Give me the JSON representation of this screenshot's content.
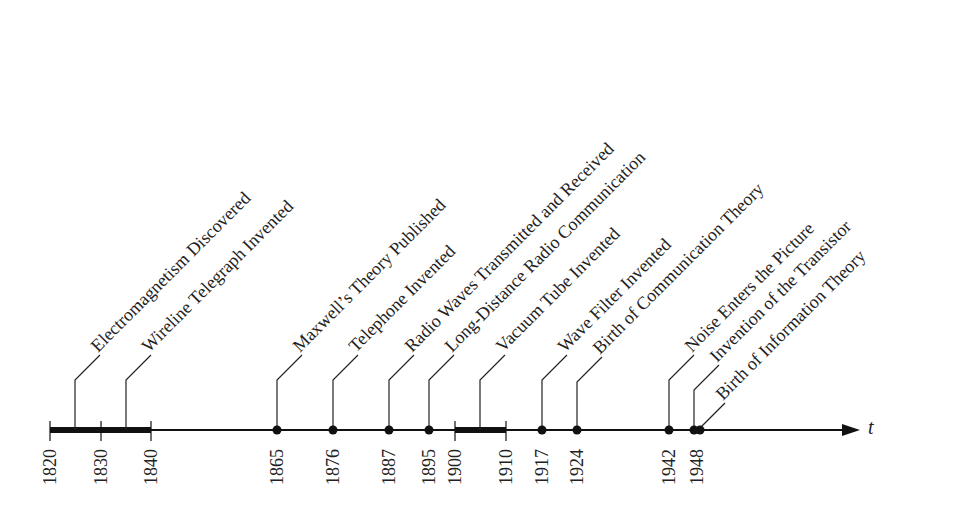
{
  "axis": {
    "variable": "t",
    "start_year": 1820,
    "end_marker": "arrow",
    "tick_years": [
      "1820",
      "1830",
      "1840",
      "1865",
      "1876",
      "1887",
      "1895",
      "1900",
      "1910",
      "1917",
      "1924",
      "1942",
      "1948"
    ]
  },
  "periods": [
    {
      "from": 1820,
      "to": 1840,
      "label": "1820–1840"
    },
    {
      "from": 1900,
      "to": 1910,
      "label": "1900–1910"
    }
  ],
  "events": [
    {
      "year": 1825,
      "label": "Electromagnetism Discovered",
      "kind": "period-mark"
    },
    {
      "year": 1835,
      "label": "Wireline Telegraph Invented",
      "kind": "period-mark"
    },
    {
      "year": 1865,
      "label": "Maxwell’s Theory Published",
      "kind": "dot"
    },
    {
      "year": 1876,
      "label": "Telephone Invented",
      "kind": "dot"
    },
    {
      "year": 1887,
      "label": "Radio Waves Transmitted and Received",
      "kind": "dot"
    },
    {
      "year": 1895,
      "label": "Long-Distance Radio Communication",
      "kind": "dot"
    },
    {
      "year": 1905,
      "label": "Vacuum Tube Invented",
      "kind": "period-mark"
    },
    {
      "year": 1917,
      "label": "Wave Filter Invented",
      "kind": "dot"
    },
    {
      "year": 1924,
      "label": "Birth of Communication Theory",
      "kind": "dot"
    },
    {
      "year": 1942,
      "label": "Noise Enters the Picture",
      "kind": "dot"
    },
    {
      "year": 1947,
      "label": "Invention of the Transistor",
      "kind": "dot"
    },
    {
      "year": 1948,
      "label": "Birth of Information Theory",
      "kind": "dot"
    }
  ],
  "colors": {
    "ink": "#111111",
    "background": "#ffffff"
  }
}
